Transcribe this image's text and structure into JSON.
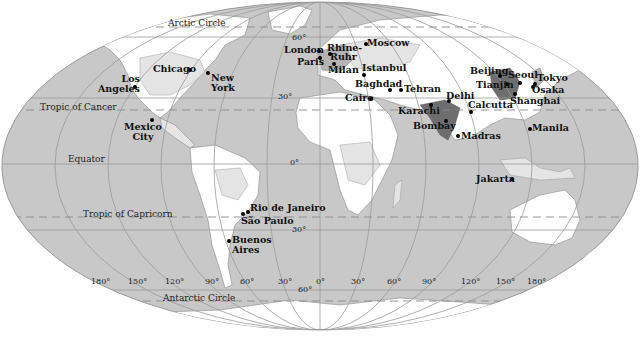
{
  "map": {
    "projection": "Mollweide world map",
    "colors": {
      "ocean": "#c8c8c8",
      "land_low": "#ffffff",
      "land_mid": "#e4e4e4",
      "land_high": "#b4b4b4",
      "land_dense": "#6e6e6e",
      "grid": "#9a9a9a",
      "background": "#ffffff"
    },
    "reference_lines": {
      "arctic_circle": "Arctic Circle",
      "tropic_cancer": "Tropic of Cancer",
      "equator": "Equator",
      "tropic_capricorn": "Tropic of Capricorn",
      "antarctic_circle": "Antarctic Circle"
    },
    "latitude_labels": {
      "lat60n": "60°",
      "lat30n": "30°",
      "lat0": "0°",
      "lat30s": "30°",
      "lat60s": "60°"
    },
    "longitude_labels": [
      "180°",
      "150°",
      "120°",
      "90°",
      "60°",
      "30°",
      "0°",
      "30°",
      "60°",
      "90°",
      "120°",
      "150°",
      "180°"
    ],
    "cities": [
      {
        "name": "Los",
        "name2": "Angeles"
      },
      {
        "name": "Chicago"
      },
      {
        "name": "New",
        "name2": "York"
      },
      {
        "name": "Mexico",
        "name2": "City"
      },
      {
        "name": "London"
      },
      {
        "name": "Paris"
      },
      {
        "name": "Rhine-",
        "name2": "Ruhr"
      },
      {
        "name": "Milan"
      },
      {
        "name": "Moscow"
      },
      {
        "name": "Istanbul"
      },
      {
        "name": "Baghdad"
      },
      {
        "name": "Cairo"
      },
      {
        "name": "Tehran"
      },
      {
        "name": "Karachi"
      },
      {
        "name": "Delhi"
      },
      {
        "name": "Bombay"
      },
      {
        "name": "Madras"
      },
      {
        "name": "Calcutta"
      },
      {
        "name": "Beijing"
      },
      {
        "name": "Tianjin"
      },
      {
        "name": "Seoul"
      },
      {
        "name": "Tokyo"
      },
      {
        "name": "Osaka"
      },
      {
        "name": "Shanghai"
      },
      {
        "name": "Manila"
      },
      {
        "name": "Jakarta"
      },
      {
        "name": "Rio de Janeiro"
      },
      {
        "name": "São Paulo"
      },
      {
        "name": "Buenos",
        "name2": "Aires"
      }
    ]
  }
}
